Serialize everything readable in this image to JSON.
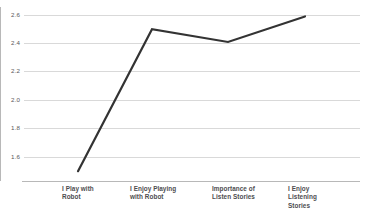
{
  "chart_data": {
    "type": "line",
    "title": "",
    "subtitle": "",
    "xlabel": "",
    "ylabel": "",
    "categories": [
      "I Play with Robot",
      "I Enjoy Playing with Robot",
      "Importance of Listen Stories",
      "I Enjoy Listening Stories"
    ],
    "category_lines": [
      [
        "I Play with",
        "Robot"
      ],
      [
        "I Enjoy Playing",
        "with Robot"
      ],
      [
        "Importance of",
        "Listen Stories"
      ],
      [
        "I Enjoy",
        "Listening",
        "Stories"
      ]
    ],
    "values": [
      1.5,
      2.5,
      2.41,
      2.59
    ],
    "series": [
      {
        "name": "Mean Score",
        "values": [
          1.5,
          2.5,
          2.41,
          2.59
        ]
      }
    ],
    "ylim": [
      1.5,
      2.6
    ],
    "yticks": [
      "2.6",
      "2.4",
      "2.2",
      "2.0",
      "1.8",
      "1.6"
    ],
    "ytick_values": [
      2.6,
      2.4,
      2.2,
      2.0,
      1.8,
      1.6
    ],
    "grid": true,
    "legend": false,
    "legend_position": "none",
    "line_color": "#333333",
    "grid_color": "#d9d9d9",
    "axis_color": "#b8b8b8",
    "background_color": "#ffffff",
    "marker": "none"
  }
}
